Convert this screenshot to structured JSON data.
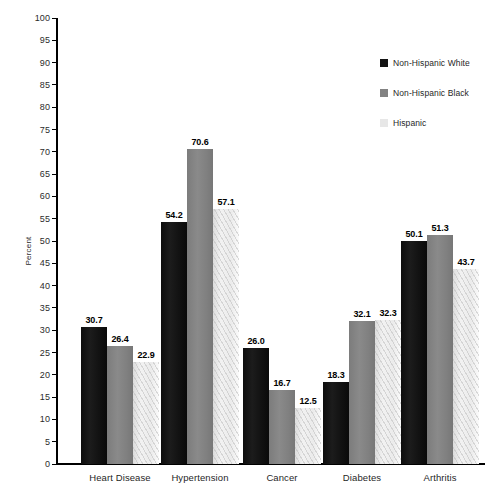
{
  "chart_data": {
    "type": "bar",
    "title": "",
    "subtitle": "",
    "xlabel": "",
    "ylabel": "Percent",
    "ylim": [
      0,
      100
    ],
    "ytick_step": 5,
    "grid": false,
    "legend_position": "top-right",
    "yticks": [
      "100",
      "95",
      "90",
      "85",
      "80",
      "75",
      "70",
      "65",
      "60",
      "55",
      "50",
      "45",
      "40",
      "35",
      "30",
      "25",
      "20",
      "15",
      "10",
      "5",
      "0"
    ],
    "categories": [
      "Heart Disease",
      "Hypertension",
      "Cancer",
      "Diabetes",
      "Arthritis"
    ],
    "series": [
      {
        "name": "Non-Hispanic White",
        "color": "#131313",
        "values": [
          30.7,
          54.2,
          26.0,
          18.3,
          50.1
        ],
        "labels": [
          "30.7",
          "54.2",
          "26.0",
          "18.3",
          "50.1"
        ]
      },
      {
        "name": "Non-Hispanic Black",
        "color": "#828282",
        "values": [
          26.4,
          70.6,
          16.7,
          32.1,
          51.3
        ],
        "labels": [
          "26.4",
          "70.6",
          "16.7",
          "32.1",
          "51.3"
        ]
      },
      {
        "name": "Hispanic",
        "color": "#e7e7e7",
        "values": [
          22.9,
          57.1,
          12.5,
          32.3,
          43.7
        ],
        "labels": [
          "22.9",
          "57.1",
          "12.5",
          "32.3",
          "43.7"
        ]
      }
    ]
  }
}
